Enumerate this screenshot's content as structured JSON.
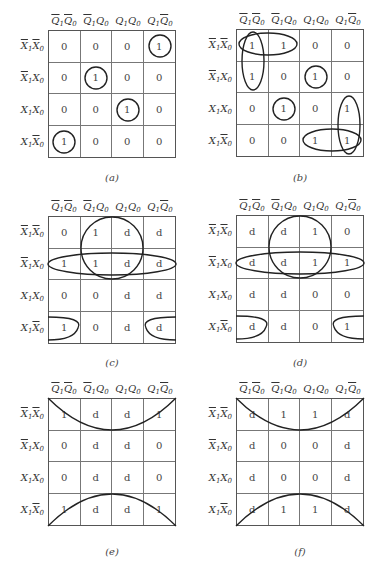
{
  "column_headers": [
    {
      "a": "Q",
      "a_bar": true,
      "a_sub": "1",
      "b": "Q",
      "b_bar": true,
      "b_sub": "0"
    },
    {
      "a": "Q",
      "a_bar": true,
      "a_sub": "1",
      "b": "Q",
      "b_bar": false,
      "b_sub": "0"
    },
    {
      "a": "Q",
      "a_bar": false,
      "a_sub": "1",
      "b": "Q",
      "b_bar": false,
      "b_sub": "0"
    },
    {
      "a": "Q",
      "a_bar": false,
      "a_sub": "1",
      "b": "Q",
      "b_bar": true,
      "b_sub": "0"
    }
  ],
  "column_header_text": [
    "Q̄1Q̄0",
    "Q̄1Q0",
    "Q1Q0",
    "Q1Q̄0"
  ],
  "row_headers": [
    {
      "a": "X",
      "a_bar": true,
      "a_sub": "1",
      "b": "X",
      "b_bar": true,
      "b_sub": "0"
    },
    {
      "a": "X",
      "a_bar": true,
      "a_sub": "1",
      "b": "X",
      "b_bar": false,
      "b_sub": "0"
    },
    {
      "a": "X",
      "a_bar": false,
      "a_sub": "1",
      "b": "X",
      "b_bar": false,
      "b_sub": "0"
    },
    {
      "a": "X",
      "a_bar": false,
      "a_sub": "1",
      "b": "X",
      "b_bar": true,
      "b_sub": "0"
    }
  ],
  "row_header_text": [
    "X̄1X̄0",
    "X̄1X0",
    "X1X0",
    "X1X̄0"
  ],
  "maps": [
    {
      "id": "a",
      "caption": "(a)",
      "cells": [
        [
          "0",
          "0",
          "0",
          "1"
        ],
        [
          "0",
          "1",
          "0",
          "0"
        ],
        [
          "0",
          "0",
          "1",
          "0"
        ],
        [
          "1",
          "0",
          "0",
          "0"
        ]
      ],
      "groups": [
        "circle r0c3",
        "circle r1c1",
        "circle r2c2",
        "circle r3c0"
      ]
    },
    {
      "id": "b",
      "caption": "(b)",
      "cells": [
        [
          "1",
          "1",
          "0",
          "0"
        ],
        [
          "1",
          "0",
          "1",
          "0"
        ],
        [
          "0",
          "1",
          "0",
          "1"
        ],
        [
          "0",
          "0",
          "1",
          "1"
        ]
      ],
      "groups": [
        "horizontal r0c0-c1",
        "vertical c0 r0-r1",
        "circle r1c2",
        "circle r2c1",
        "vertical c3 r2-r3",
        "horizontal r3c2-c3"
      ]
    },
    {
      "id": "c",
      "caption": "(c)",
      "cells": [
        [
          "0",
          "1",
          "d",
          "d"
        ],
        [
          "1",
          "1",
          "d",
          "d"
        ],
        [
          "0",
          "0",
          "d",
          "d"
        ],
        [
          "1",
          "0",
          "d",
          "d"
        ]
      ],
      "groups": [
        "quad r0-r1 c1-c2",
        "row r1 all",
        "wrap r3 c0+c3"
      ]
    },
    {
      "id": "d",
      "caption": "(d)",
      "cells": [
        [
          "d",
          "d",
          "1",
          "0"
        ],
        [
          "d",
          "d",
          "1",
          "1"
        ],
        [
          "d",
          "d",
          "0",
          "0"
        ],
        [
          "d",
          "d",
          "0",
          "1"
        ]
      ],
      "groups": [
        "quad r0-r1 c1-c2",
        "row r1 all",
        "wrap r3 c0+c3"
      ]
    },
    {
      "id": "e",
      "caption": "(e)",
      "cells": [
        [
          "1",
          "d",
          "d",
          "1"
        ],
        [
          "0",
          "d",
          "d",
          "0"
        ],
        [
          "0",
          "d",
          "d",
          "0"
        ],
        [
          "1",
          "d",
          "d",
          "1"
        ]
      ],
      "groups": [
        "wrap-top row r0",
        "wrap-bottom row r3"
      ]
    },
    {
      "id": "f",
      "caption": "(f)",
      "cells": [
        [
          "d",
          "1",
          "1",
          "d"
        ],
        [
          "d",
          "0",
          "0",
          "d"
        ],
        [
          "d",
          "0",
          "0",
          "d"
        ],
        [
          "d",
          "1",
          "1",
          "d"
        ]
      ],
      "groups": [
        "wrap-top row r0",
        "wrap-bottom row r3"
      ]
    }
  ]
}
